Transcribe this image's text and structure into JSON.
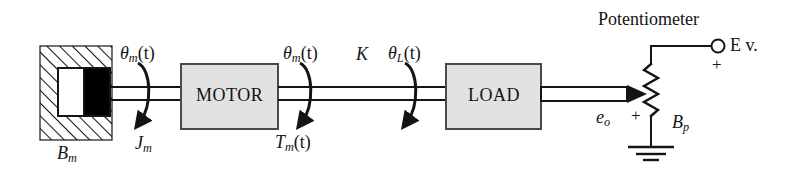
{
  "figure": {
    "colors": {
      "line": "#141414",
      "box_fill": "#e2e2e2",
      "box_border": "#4a4a4a",
      "damper_piston": "#000000",
      "damper_chamber": "#ffffff",
      "background": "#ffffff"
    }
  },
  "blocks": {
    "motor_label": "MOTOR",
    "load_label": "LOAD"
  },
  "labels": {
    "potentiometer": "Potentiometer",
    "theta_m_left": {
      "sym": "θ",
      "sub": "m",
      "arg": "(t)"
    },
    "theta_m_right": {
      "sym": "θ",
      "sub": "m",
      "arg": "(t)"
    },
    "theta_L": {
      "sym": "θ",
      "sub": "L",
      "arg": "(t)"
    },
    "spring_constant": "K",
    "inertia_Jm": {
      "sym": "J",
      "sub": "m"
    },
    "torque_Tm": {
      "sym": "T",
      "sub": "m",
      "arg": "(t)"
    },
    "damping_Bm": {
      "sym": "B",
      "sub": "m"
    },
    "pot_resistance_Bp": {
      "sym": "B",
      "sub": "p"
    },
    "output_voltage_eo": {
      "sym": "e",
      "sub": "o"
    },
    "supply_terminal": "E v.",
    "plus_supply": "+",
    "plus_output": "+"
  }
}
